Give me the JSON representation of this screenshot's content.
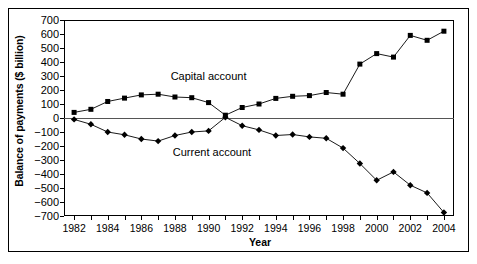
{
  "chart_data": {
    "type": "line",
    "title": "",
    "xlabel": "Year",
    "ylabel": "Balance of payments ($ billion)",
    "x": [
      1982,
      1983,
      1984,
      1985,
      1986,
      1987,
      1988,
      1989,
      1990,
      1991,
      1992,
      1993,
      1994,
      1995,
      1996,
      1997,
      1998,
      1999,
      2000,
      2001,
      2002,
      2003,
      2004
    ],
    "xlim": [
      1981.4,
      2004.6
    ],
    "ylim": [
      -700,
      700
    ],
    "yticks": [
      700,
      600,
      500,
      400,
      300,
      200,
      100,
      0,
      -100,
      -200,
      -300,
      -400,
      -500,
      -600,
      -700
    ],
    "ytick_labels": [
      "700",
      "600",
      "500",
      "400",
      "300",
      "200",
      "100",
      "0",
      "−100",
      "−200",
      "−300",
      "−400",
      "−500",
      "−600",
      "−700"
    ],
    "xtick_labels": [
      "1982",
      "1984",
      "1986",
      "1988",
      "1990",
      "1992",
      "1994",
      "1996",
      "1998",
      "2000",
      "2002",
      "2004"
    ],
    "xtick_values": [
      1982,
      1984,
      1986,
      1988,
      1990,
      1992,
      1994,
      1996,
      1998,
      2000,
      2002,
      2004
    ],
    "grid": false,
    "legend": "inline-annotations",
    "zero_line": true,
    "series": [
      {
        "name": "Capital account",
        "marker": "square",
        "color": "#000000",
        "label_x": 1990.0,
        "label_y": 290,
        "values": [
          40,
          62,
          118,
          142,
          165,
          170,
          150,
          145,
          110,
          20,
          75,
          100,
          140,
          155,
          160,
          182,
          170,
          385,
          460,
          435,
          590,
          555,
          620
        ]
      },
      {
        "name": "Current account",
        "marker": "diamond",
        "color": "#000000",
        "label_x": 1990.2,
        "label_y": -250,
        "values": [
          -10,
          -45,
          -100,
          -120,
          -150,
          -165,
          -125,
          -100,
          -92,
          5,
          -55,
          -85,
          -125,
          -118,
          -135,
          -145,
          -215,
          -325,
          -445,
          -385,
          -480,
          -535,
          -675
        ]
      }
    ]
  }
}
